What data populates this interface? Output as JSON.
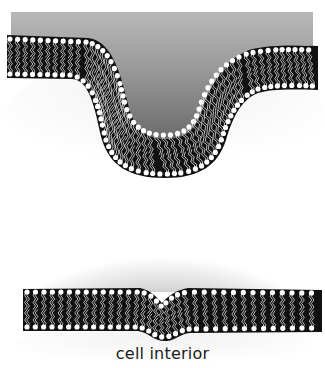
{
  "figure": {
    "panels": [
      {
        "id": "top",
        "description": "Lipid bilayer strongly invaginated into a U-shaped pit beneath a gray gradient region",
        "region_color_top": "#b3b3b3",
        "region_color_bottom": "#6e6e6e"
      },
      {
        "id": "bottom",
        "description": "Nearly flat lipid bilayer with a small dimple beneath a radial gray gradient",
        "region_color_center": "#5a5a5a"
      }
    ],
    "label": "cell interior",
    "colors": {
      "membrane_fill": "#111111",
      "lipid_head": "#ffffff",
      "lipid_tail": "#e8e8e8",
      "background": "#ffffff",
      "interior_halo": "#f2f2f2"
    }
  }
}
